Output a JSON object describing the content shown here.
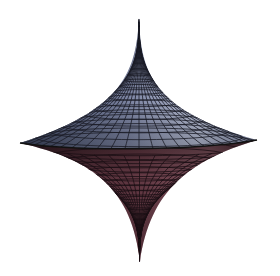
{
  "figure": {
    "background": "#ffffff",
    "upper_color_light": "#b8bfd6",
    "upper_color_dark": "#3d4660",
    "lower_color_light": "#8a5a66",
    "lower_color_dark": "#3a1f28",
    "grid_color": "#1a1c26",
    "apex": [
      139,
      18
    ],
    "bottom_tip": [
      140,
      262
    ],
    "left_cusp": [
      20,
      143
    ],
    "right_cusp": [
      257,
      140
    ]
  }
}
